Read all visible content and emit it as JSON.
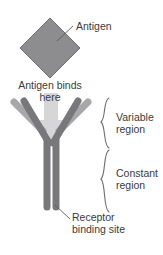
{
  "diagram": {
    "background_color": "#ffffff",
    "text_color": "#3a3a3c",
    "labels": {
      "antigen": "Antigen",
      "antigen_binds_line1": "Antigen binds",
      "antigen_binds_line2": "here",
      "variable_line1": "Variable",
      "variable_line2": "region",
      "constant_line1": "Constant",
      "constant_line2": "region",
      "receptor_line1": "Receptor",
      "receptor_line2": "binding site"
    },
    "shapes": {
      "antigen": {
        "name": "antigen-diamond",
        "fill": "#8d8d8f",
        "stroke": "#6e6e70",
        "center_x": 50,
        "center_y": 48,
        "half_width": 30,
        "half_height": 30
      },
      "antibody": {
        "name": "antibody-y-shape",
        "light_chain_color": "#a7a7a9",
        "heavy_chain_color": "#78787a",
        "arm_width": 7,
        "stem_top_y": 147,
        "stem_bottom_y": 210
      },
      "binding_arrow": {
        "name": "binding-direction-arrow",
        "fill": "#d6d6d6",
        "direction": "down",
        "tip_y": 139
      },
      "braces": {
        "color": "#6e6e70",
        "variable": {
          "top_y": 98,
          "bottom_y": 148
        },
        "constant": {
          "top_y": 150,
          "bottom_y": 212
        }
      },
      "leader_lines": {
        "color": "#5a5a5c",
        "antigen": {
          "x1": 73,
          "y1": 26,
          "x2": 58,
          "y2": 40
        },
        "receptor": {
          "x1": 70,
          "y1": 219,
          "x2": 54,
          "y2": 205
        }
      }
    }
  }
}
